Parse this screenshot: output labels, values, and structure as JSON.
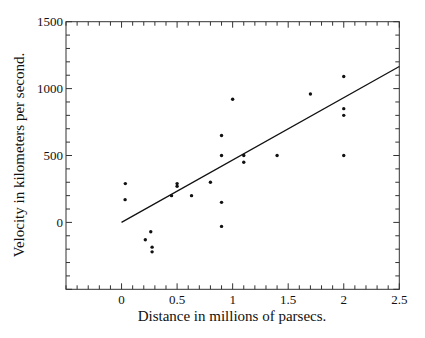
{
  "chart_data": {
    "type": "scatter",
    "title": "",
    "xlabel": "Distance in millions of parsecs.",
    "ylabel": "Velocity in kilometers per second.",
    "xlim": [
      -0.5,
      2.5
    ],
    "ylim": [
      -500,
      1500
    ],
    "x_ticks": [
      0,
      0.5,
      1,
      1.5,
      2,
      2.5
    ],
    "x_tick_labels": [
      "0",
      "0.5",
      "1",
      "1.5",
      "2",
      "2.5"
    ],
    "y_ticks": [
      0,
      500,
      1000,
      1500
    ],
    "y_tick_labels": [
      "0",
      "500",
      "1000",
      "1500"
    ],
    "x_minor_step": 0.1,
    "y_minor_step": 100,
    "grid": false,
    "legend": null,
    "series": [
      {
        "name": "nebulae",
        "type": "scatter",
        "x": [
          0.032,
          0.034,
          0.214,
          0.263,
          0.275,
          0.275,
          0.45,
          0.5,
          0.5,
          0.63,
          0.8,
          0.9,
          0.9,
          0.9,
          0.9,
          1.0,
          1.1,
          1.1,
          1.4,
          1.7,
          2.0,
          2.0,
          2.0,
          2.0
        ],
        "y": [
          170,
          290,
          -130,
          -70,
          -185,
          -220,
          200,
          290,
          270,
          200,
          300,
          -30,
          650,
          150,
          500,
          920,
          450,
          500,
          500,
          960,
          500,
          850,
          800,
          1090
        ]
      },
      {
        "name": "fit line",
        "type": "line",
        "x": [
          0,
          2.5
        ],
        "y": [
          0,
          1165
        ]
      }
    ]
  }
}
